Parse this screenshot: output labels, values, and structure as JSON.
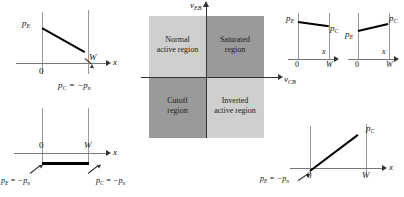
{
  "figure": {
    "name": "bjt-operating-regions-carrier-profiles",
    "colors": {
      "quadrant_light": "#cfcfcf",
      "quadrant_dark": "#9a9a9a",
      "curve": "#000000",
      "axis": "#808080",
      "axis_dark": "#333333",
      "background": "#ffffff"
    }
  },
  "center": {
    "name": "operating-region-map",
    "vertical_axis_label": "v",
    "vertical_axis_sub": "EB",
    "horizontal_axis_label": "v",
    "horizontal_axis_sub": "CB",
    "quadrants": [
      {
        "id": "normal-active",
        "line1": "Normal",
        "line2": "active region",
        "shade": "light",
        "position": "top-left"
      },
      {
        "id": "saturated",
        "line1": "Saturated",
        "line2": "region",
        "shade": "dark",
        "position": "top-right"
      },
      {
        "id": "cutoff",
        "line1": "Cutoff",
        "line2": "region",
        "shade": "dark",
        "position": "bottom-left"
      },
      {
        "id": "inverted-active",
        "line1": "Inverted",
        "line2": "active region",
        "shade": "light",
        "position": "bottom-right"
      }
    ]
  },
  "plots": {
    "normal_active": {
      "name": "plot-normal-active",
      "x_axis_label": "x",
      "origin_label": "0",
      "width_label": "W",
      "left_label": {
        "symbol": "p",
        "sub": "E"
      },
      "right_label": {
        "text": "p",
        "sub": "C",
        "equals": "= −p",
        "sub2": "n"
      },
      "description": "linearly decreasing from pE at x=0 to −pn at x=W"
    },
    "saturated": {
      "name": "plot-saturated",
      "x_axis_label": "x",
      "origin_label": "0",
      "width_label": "W",
      "left_label": {
        "symbol": "p",
        "sub": "E"
      },
      "right_label": {
        "symbol": "p",
        "sub": "C"
      },
      "description": "slightly decreasing from high pE to slightly lower pC, both positive"
    },
    "inverted_active_top": {
      "name": "plot-inverted-active-top",
      "x_axis_label": "x",
      "origin_label": "0",
      "width_label": "W",
      "left_label": {
        "symbol": "p",
        "sub": "E"
      },
      "right_label": {
        "symbol": "p",
        "sub": "C"
      },
      "description": "slightly increasing from pE to higher pC, both positive"
    },
    "cutoff": {
      "name": "plot-cutoff",
      "x_axis_label": "x",
      "origin_label": "0",
      "width_label": "W",
      "left_label": {
        "text": "p",
        "sub": "E",
        "equals": "= −p",
        "sub2": "n"
      },
      "right_label": {
        "text": "p",
        "sub": "C",
        "equals": "= −p",
        "sub2": "n"
      },
      "description": "flat line at −pn across the base from x=0 to x=W"
    },
    "inverted_active_bottom": {
      "name": "plot-inverted-active-bottom",
      "x_axis_label": "x",
      "origin_label": "0",
      "width_label": "W",
      "left_label": {
        "text": "p",
        "sub": "E",
        "equals": "= −p",
        "sub2": "n"
      },
      "right_label": {
        "symbol": "p",
        "sub": "C"
      },
      "description": "linearly increasing from −pn at x=0 up to pC at x=W"
    }
  }
}
